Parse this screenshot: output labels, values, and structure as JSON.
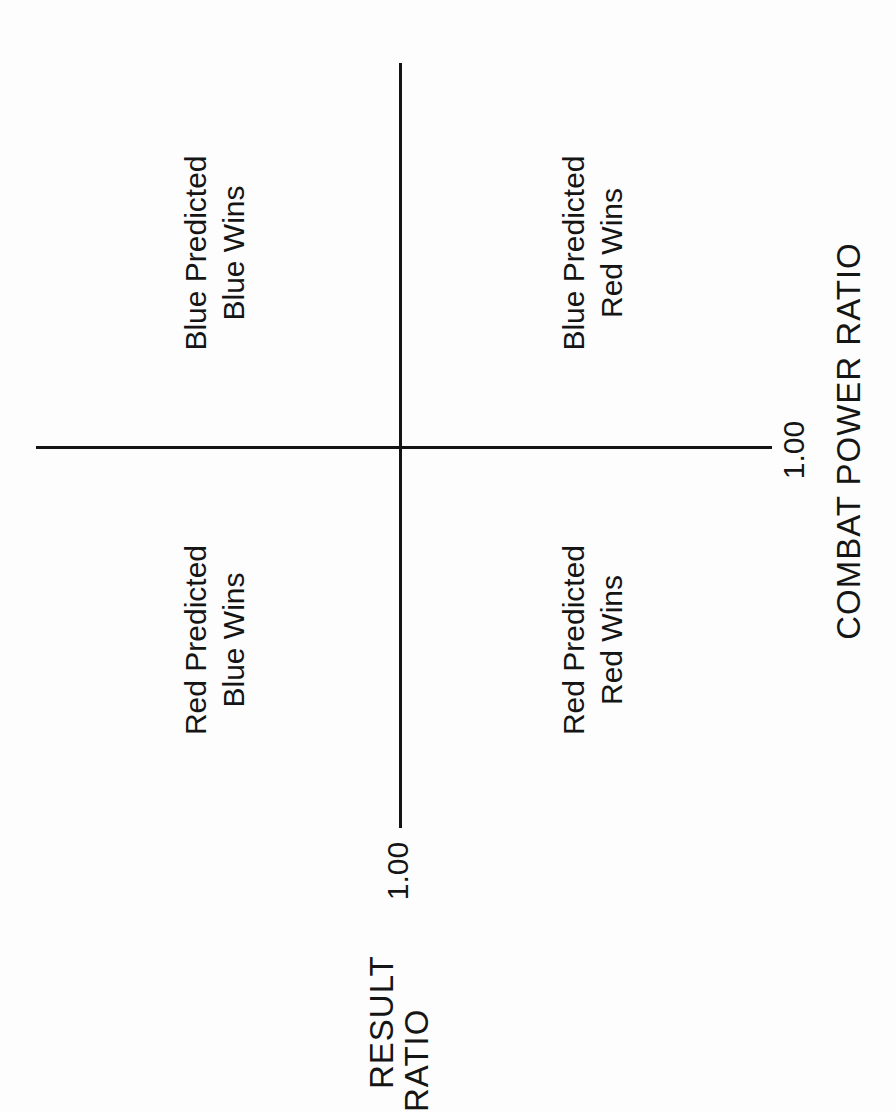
{
  "diagram": {
    "type": "quadrant",
    "horizontal_axis": {
      "title": "COMBAT POWER RATIO",
      "tick_label": "1.00"
    },
    "vertical_axis": {
      "title_line1": "RESULT",
      "title_line2": "RATIO",
      "tick_label": "1.00"
    },
    "quadrants": {
      "top_left": {
        "line1": "Blue Predicted",
        "line2": "Blue Wins"
      },
      "top_right": {
        "line1": "Blue Predicted",
        "line2": "Red Wins"
      },
      "bottom_left": {
        "line1": "Red Predicted",
        "line2": "Blue Wins"
      },
      "bottom_right": {
        "line1": "Red Predicted",
        "line2": "Red Wins"
      }
    },
    "colors": {
      "line": "#141414",
      "text": "#151515",
      "background": "#fdfdfd"
    }
  }
}
